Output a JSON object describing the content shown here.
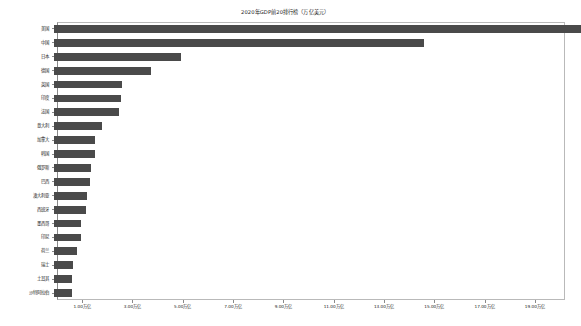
{
  "chart_data": {
    "type": "bar",
    "orientation": "horizontal",
    "title": "2020年GDP前20排行榜（万亿美元）",
    "xlabel": "",
    "ylabel": "",
    "unit_suffix": "万亿",
    "xlim": [
      0,
      20.2
    ],
    "grid": false,
    "legend": null,
    "bar_color": "#4a4a4a",
    "categories": [
      "美国",
      "中国",
      "日本",
      "德国",
      "英国",
      "印度",
      "法国",
      "意大利",
      "加拿大",
      "韩国",
      "俄罗斯",
      "巴西",
      "澳大利亚",
      "西班牙",
      "墨西哥",
      "印尼",
      "荷兰",
      "瑞士",
      "土耳其",
      "沙特阿拉伯"
    ],
    "values": [
      20.94,
      14.72,
      5.05,
      3.85,
      2.71,
      2.66,
      2.6,
      1.89,
      1.64,
      1.63,
      1.48,
      1.44,
      1.33,
      1.28,
      1.07,
      1.06,
      0.91,
      0.75,
      0.72,
      0.7
    ],
    "tick_values": [
      1,
      3,
      5,
      7,
      9,
      11,
      13,
      15,
      17,
      19
    ],
    "tick_labels": [
      "1.00万亿",
      "3.00万亿",
      "5.00万亿",
      "7.00万亿",
      "9.00万亿",
      "11.00万亿",
      "13.00万亿",
      "15.00万亿",
      "17.00万亿",
      "19.00万亿"
    ]
  }
}
